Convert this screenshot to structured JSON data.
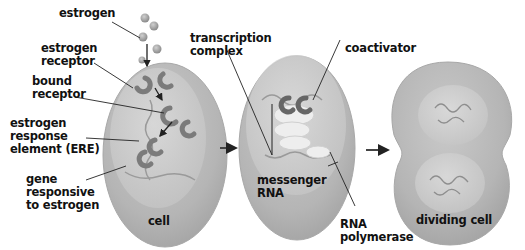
{
  "diagram": {
    "panels": [
      {
        "id": "cell",
        "caption": "cell"
      },
      {
        "id": "transcription",
        "caption": ""
      },
      {
        "id": "dividing",
        "caption": "dividing cell"
      }
    ],
    "labels": {
      "estrogen": "estrogen",
      "estrogen_receptor_1": "estrogen",
      "estrogen_receptor_2": "receptor",
      "bound_receptor_1": "bound",
      "bound_receptor_2": "receptor",
      "ere_1": "estrogen",
      "ere_2": "response",
      "ere_3": "element (ERE)",
      "gene_1": "gene",
      "gene_2": "responsive",
      "gene_3": "to estrogen",
      "cell": "cell",
      "transcription_complex_1": "transcription",
      "transcription_complex_2": "complex",
      "coactivator": "coactivator",
      "messenger_rna_1": "messenger",
      "messenger_rna_2": "RNA",
      "rna_polymerase_1": "RNA",
      "rna_polymerase_2": "polymerase",
      "dividing_cell": "dividing cell"
    },
    "colors": {
      "cytoplasm": "#b9b9b9",
      "cell_rim": "#cfcfcf",
      "nucleus": "#d2d2d2",
      "receptor": "#8a8a8a",
      "estrogen_dot": "#a5a5a5",
      "text": "#111111",
      "arrow": "#333333"
    }
  }
}
